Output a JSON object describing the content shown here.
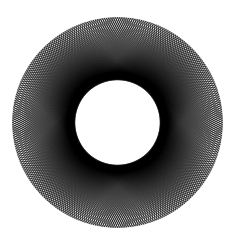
{
  "figure": {
    "name": "string-art-circle-envelope",
    "kind": "geometric-line-art",
    "background_color": "#ffffff",
    "line_color": "#000000",
    "canvas": {
      "width": 238,
      "height": 244
    },
    "geometry": {
      "center_x": 117.5,
      "center_y": 122.5,
      "outer_radius": 105,
      "inner_envelope_radius": 44.5,
      "point_count": 300,
      "chord_step": 108,
      "chord_count": 300,
      "stroke_width": 0.45,
      "stroke_opacity": 0.62,
      "extra_passes": [
        {
          "step": 109,
          "stroke_width": 0.4,
          "stroke_opacity": 0.5
        },
        {
          "step": 107,
          "stroke_width": 0.4,
          "stroke_opacity": 0.5
        },
        {
          "step": 110,
          "stroke_width": 0.35,
          "stroke_opacity": 0.38
        },
        {
          "step": 106,
          "stroke_width": 0.35,
          "stroke_opacity": 0.38
        }
      ],
      "rim_stroke_width": 0.5,
      "rim_stroke_opacity": 0.55
    }
  }
}
